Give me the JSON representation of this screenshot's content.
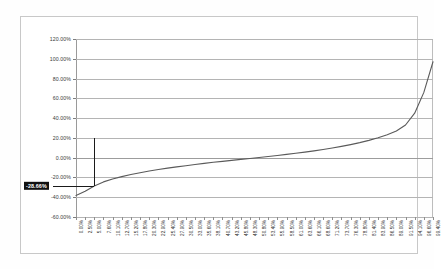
{
  "chart_data": {
    "type": "line",
    "title": "",
    "xlabel": "",
    "ylabel": "",
    "ylim": [
      -60,
      120
    ],
    "ytick_values": [
      120,
      100,
      80,
      60,
      40,
      20,
      0,
      -20,
      -40,
      -60
    ],
    "ytick_labels": [
      "120.00%",
      "100.00%",
      "80.00%",
      "60.00%",
      "40.00%",
      "20.00%",
      "0.00%",
      "-20.00%",
      "-40.00%",
      "-60.00%"
    ],
    "grid": true,
    "legend": "none",
    "annotation": {
      "label": "-28.66%",
      "value": -28.66,
      "style": "white-on-black-highlight",
      "axis": "y",
      "leader_line": true
    },
    "categories": [
      "0.00%",
      "2.50%",
      "5.00%",
      "7.60%",
      "10.10%",
      "12.70%",
      "15.20%",
      "17.80%",
      "20.30%",
      "22.90%",
      "25.40%",
      "27.90%",
      "30.50%",
      "33.00%",
      "35.60%",
      "38.10%",
      "40.70%",
      "43.20%",
      "45.80%",
      "48.30%",
      "50.80%",
      "53.40%",
      "55.90%",
      "58.50%",
      "61.00%",
      "63.60%",
      "66.10%",
      "68.60%",
      "71.20%",
      "73.70%",
      "76.30%",
      "78.80%",
      "81.40%",
      "83.90%",
      "86.50%",
      "89.00%",
      "91.50%",
      "94.10%",
      "96.60%",
      "99.40%"
    ],
    "values": [
      -38.2,
      -34.0,
      -28.66,
      -24.5,
      -21.6,
      -19.2,
      -17.1,
      -15.2,
      -13.5,
      -12.0,
      -10.6,
      -9.3,
      -8.1,
      -6.9,
      -5.8,
      -4.7,
      -3.7,
      -2.7,
      -1.7,
      -0.8,
      0.2,
      1.2,
      2.2,
      3.3,
      4.4,
      5.6,
      6.9,
      8.3,
      9.8,
      11.4,
      13.2,
      15.2,
      17.5,
      20.1,
      23.2,
      26.9,
      33.0,
      45.0,
      66.0,
      97.0
    ],
    "series_color": "#5a5a5a"
  }
}
